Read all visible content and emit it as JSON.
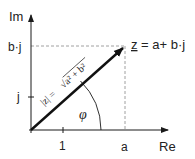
{
  "diagram": {
    "axes": {
      "x_label": "Re",
      "y_label": "Im",
      "x_tick_label": "1",
      "y_tick_label": "j"
    },
    "point": {
      "x_label": "a",
      "y_label": "b·j",
      "label": "z = a+ b·j",
      "label_z": "z",
      "label_rest": " = a+ b·j"
    },
    "vector": {
      "magnitude_label": "|z| = √(a² + b²)",
      "magnitude_lhs": "|z| = ",
      "magnitude_rhs": "√a² + b²"
    },
    "angle_label": "φ",
    "colors": {
      "axis": "#1a1a1a",
      "vector": "#111111",
      "dashed": "#888888",
      "background": "#ffffff"
    }
  }
}
